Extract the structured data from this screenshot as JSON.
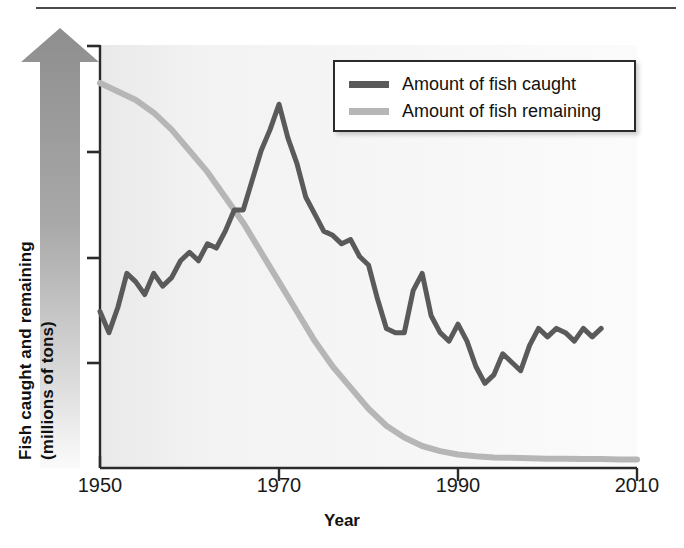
{
  "figure": {
    "background": "#ffffff",
    "top_rule_color": "#4a4a4a"
  },
  "chart_data": {
    "type": "line",
    "title": "",
    "subtitle": "",
    "xlabel": "Year",
    "ylabel": "Fish caught and remaining (millions of tons)",
    "ylabel_line1": "Fish caught and remaining",
    "ylabel_line2": "(millions of tons)",
    "xlim": [
      1950,
      2010
    ],
    "ylim": [
      0,
      100
    ],
    "xticks": [
      1950,
      1970,
      1990,
      2010
    ],
    "xticklabels": [
      "1950",
      "1970",
      "1990",
      "2010"
    ],
    "yticks": [
      0,
      25,
      50,
      75,
      100
    ],
    "yticklabels": [
      "",
      "",
      "",
      "",
      ""
    ],
    "grid": false,
    "legend_position": "top-right",
    "series": [
      {
        "name": "Amount of fish caught",
        "color": "#5a5a5a",
        "linewidth": 5,
        "x": [
          1950,
          1951,
          1952,
          1953,
          1954,
          1955,
          1956,
          1957,
          1958,
          1959,
          1960,
          1961,
          1962,
          1963,
          1964,
          1965,
          1966,
          1967,
          1968,
          1969,
          1970,
          1971,
          1972,
          1973,
          1974,
          1975,
          1976,
          1977,
          1978,
          1979,
          1980,
          1981,
          1982,
          1983,
          1984,
          1985,
          1986,
          1987,
          1988,
          1989,
          1990,
          1991,
          1992,
          1993,
          1994,
          1995,
          1996,
          1997,
          1998,
          1999,
          2000,
          2001,
          2002,
          2003,
          2004,
          2005,
          2006
        ],
        "y": [
          37,
          32,
          38,
          46,
          44,
          41,
          46,
          43,
          45,
          49,
          51,
          49,
          53,
          52,
          56,
          61,
          61,
          68,
          75,
          80,
          86,
          78,
          72,
          64,
          60,
          56,
          55,
          53,
          54,
          50,
          48,
          40,
          33,
          32,
          32,
          42,
          46,
          36,
          32,
          30,
          34,
          30,
          24,
          20,
          22,
          27,
          25,
          23,
          29,
          33,
          31,
          33,
          32,
          30,
          33,
          31,
          33
        ]
      },
      {
        "name": "Amount of fish remaining",
        "color": "#b6b6b6",
        "linewidth": 6,
        "x": [
          1950,
          1952,
          1954,
          1956,
          1958,
          1960,
          1962,
          1964,
          1966,
          1968,
          1970,
          1972,
          1974,
          1976,
          1978,
          1980,
          1982,
          1984,
          1986,
          1988,
          1990,
          1992,
          1994,
          1996,
          1998,
          2000,
          2002,
          2004,
          2006,
          2008,
          2010
        ],
        "y": [
          91,
          89,
          87,
          84,
          80,
          75,
          70,
          64,
          58,
          51,
          44,
          37,
          30,
          24,
          19,
          14,
          10,
          7.2,
          5.2,
          4.0,
          3.2,
          2.8,
          2.5,
          2.4,
          2.3,
          2.2,
          2.2,
          2.1,
          2.1,
          2.0,
          2.0
        ]
      }
    ]
  },
  "legend": {
    "entries": [
      {
        "label": "Amount of fish caught",
        "color": "#5a5a5a"
      },
      {
        "label": "Amount of fish remaining",
        "color": "#b6b6b6"
      }
    ]
  },
  "axes": {
    "x_tick_labels": [
      "1950",
      "1970",
      "1990",
      "2010"
    ],
    "x_axis_title": "Year",
    "y_axis_title_line1": "Fish caught and remaining",
    "y_axis_title_line2": "(millions of tons)"
  }
}
